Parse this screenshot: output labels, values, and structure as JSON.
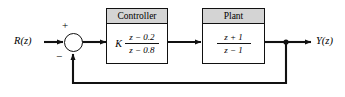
{
  "diagram": {
    "colors": {
      "line": "#111111",
      "header_fill": "#d4d4d4",
      "block_fill": "#ffffff",
      "background": "#ffffff"
    },
    "input": {
      "label": "R(z)",
      "name": "reference-input"
    },
    "output": {
      "label": "Y(z)",
      "name": "system-output"
    },
    "summing_junction": {
      "positive_sign": "+",
      "negative_sign": "−",
      "name": "summing-junction"
    },
    "blocks": [
      {
        "id": "controller",
        "header": "Controller",
        "gain": "K",
        "numerator": "z − 0.2",
        "denominator": "z − 0.8",
        "transfer_function": "K (z − 0.2)/(z − 0.8)"
      },
      {
        "id": "plant",
        "header": "Plant",
        "gain": "",
        "numerator": "z + 1",
        "denominator": "z − 1",
        "transfer_function": "(z + 1)/(z − 1)"
      }
    ],
    "feedback": {
      "type": "unity-negative-feedback",
      "path_name": "feedback-path"
    }
  }
}
